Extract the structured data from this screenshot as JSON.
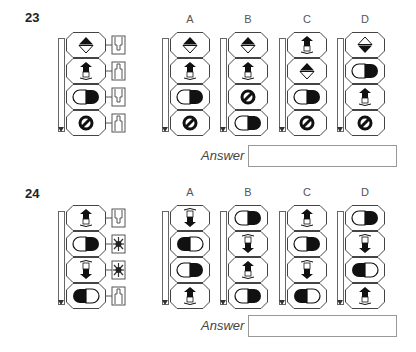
{
  "questions": [
    {
      "number": "23",
      "source": {
        "cells": [
          "diamond-top-filled",
          "arrow-up-filled",
          "pill-right-filled",
          "no-sign"
        ],
        "connectors": [
          "plug-down",
          "plug-up",
          "plug-down",
          "plug-up"
        ]
      },
      "options": [
        {
          "label": "A",
          "cells": [
            "diamond-top-filled",
            "arrow-up-filled",
            "pill-right-filled",
            "no-sign"
          ]
        },
        {
          "label": "B",
          "cells": [
            "diamond-top-filled",
            "arrow-up-filled",
            "no-sign",
            "pill-right-filled"
          ]
        },
        {
          "label": "C",
          "cells": [
            "arrow-up-filled",
            "diamond-top-filled",
            "pill-right-filled",
            "no-sign"
          ]
        },
        {
          "label": "D",
          "cells": [
            "diamond-bottom-filled",
            "pill-right-filled",
            "arrow-up-filled",
            "no-sign"
          ]
        }
      ],
      "answer_label": "Answer",
      "answer_value": ""
    },
    {
      "number": "24",
      "source": {
        "cells": [
          "arrow-up-filled",
          "pill-right-filled",
          "arrow-down-filled",
          "pill-left-filled"
        ],
        "connectors": [
          "plug-down",
          "star-burst",
          "star-burst",
          "plug-up"
        ]
      },
      "options": [
        {
          "label": "A",
          "cells": [
            "arrow-down-filled",
            "pill-left-filled",
            "pill-right-filled",
            "arrow-up-filled"
          ]
        },
        {
          "label": "B",
          "cells": [
            "pill-right-filled",
            "arrow-down-filled",
            "arrow-up-filled",
            "pill-right-filled"
          ]
        },
        {
          "label": "C",
          "cells": [
            "arrow-up-filled",
            "pill-right-filled",
            "arrow-down-filled",
            "pill-left-filled"
          ]
        },
        {
          "label": "D",
          "cells": [
            "pill-right-filled",
            "arrow-down-filled",
            "pill-left-filled",
            "arrow-up-filled"
          ]
        }
      ],
      "answer_label": "Answer",
      "answer_value": ""
    }
  ]
}
